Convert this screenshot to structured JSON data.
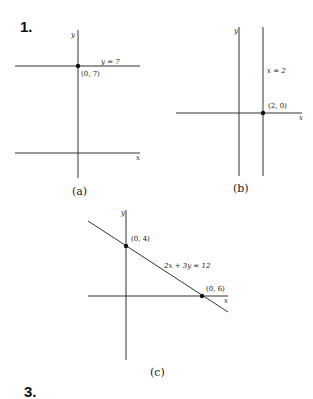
{
  "problems": [
    {
      "number_label": "1."
    },
    {
      "number_label": "3."
    }
  ],
  "graphs": {
    "a": {
      "caption": "(a)",
      "x_axis_label": "x",
      "y_axis_label": "y",
      "line_label": "y = 7",
      "point_label": "(0, 7)"
    },
    "b": {
      "caption": "(b)",
      "x_axis_label": "x",
      "y_axis_label": "y",
      "line_label": "x = 2",
      "point_label": "(2, 0)"
    },
    "c": {
      "caption": "(c)",
      "x_axis_label": "x",
      "y_axis_label": "y",
      "line_label": "2x + 3y = 12",
      "point1_label": "(0, 4)",
      "point2_label": "(0, 6)"
    }
  }
}
